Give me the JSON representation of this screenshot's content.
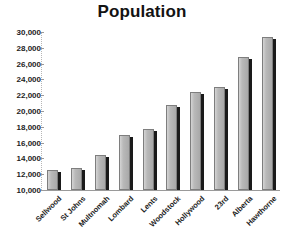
{
  "chart_data": {
    "type": "bar",
    "title": "Population",
    "xlabel": "",
    "ylabel": "",
    "categories": [
      "Sellwood",
      "St Johns",
      "Multnomah",
      "Lombard",
      "Lents",
      "Woodstock",
      "Hollywood",
      "23rd",
      "Alberta",
      "Hawthorne"
    ],
    "values": [
      12500,
      12800,
      14400,
      17000,
      17700,
      20800,
      22400,
      23000,
      26800,
      29400
    ],
    "ylim": [
      10000,
      30000
    ],
    "ytick_labels": [
      "30,000",
      "28,000",
      "26,000",
      "24,000",
      "22,000",
      "20,000",
      "18,000",
      "16,000",
      "14,000",
      "12,000",
      "10,000"
    ],
    "ytick_values": [
      30000,
      28000,
      26000,
      24000,
      22000,
      20000,
      18000,
      16000,
      14000,
      12000,
      10000
    ],
    "grid": false,
    "legend": false,
    "bar_color": "#b9b9b9",
    "bar_edge_color": "#7e7e7e",
    "bar_shadow_color": "#1a1a1a",
    "background_color": "#ffffff",
    "text_color": "#1d1d1d"
  }
}
